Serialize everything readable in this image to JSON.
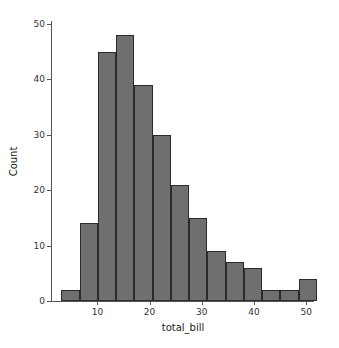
{
  "chart_data": {
    "type": "bar",
    "subtype": "histogram",
    "title": "",
    "xlabel": "total_bill",
    "ylabel": "Count",
    "xlim": [
      1.3,
      51.5
    ],
    "ylim": [
      0,
      50.5
    ],
    "xticks": [
      10,
      20,
      30,
      40,
      50
    ],
    "xtick_labels": [
      "10",
      "20",
      "30",
      "40",
      "50"
    ],
    "yticks": [
      0,
      10,
      20,
      30,
      40,
      50
    ],
    "ytick_labels": [
      "0",
      "10",
      "20",
      "30",
      "40",
      "50"
    ],
    "grid": false,
    "legend": null,
    "bin_width": 3.5,
    "bin_edges": [
      3.07,
      6.57,
      10.07,
      13.57,
      17.07,
      20.57,
      24.07,
      27.57,
      31.07,
      34.57,
      38.07,
      41.57,
      45.07,
      48.57,
      52.07
    ],
    "bin_centers": [
      4.82,
      8.32,
      11.82,
      15.32,
      18.82,
      22.32,
      25.82,
      29.32,
      32.82,
      36.32,
      39.82,
      43.32,
      46.82,
      50.32
    ],
    "values": [
      2,
      14,
      45,
      48,
      39,
      30,
      21,
      15,
      9,
      7,
      6,
      2,
      2,
      4
    ],
    "bar_color": "#6f6f6f",
    "bar_edge_color": "#2b2b2b",
    "background_color": "#ffffff",
    "axis_color": "#555555"
  }
}
